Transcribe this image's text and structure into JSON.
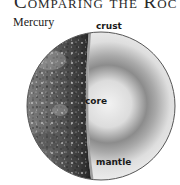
{
  "header": {
    "title": "Comparing the Roc"
  },
  "planet": {
    "name": "Mercury",
    "layers": {
      "crust": "crust",
      "core": "core",
      "mantle": "mantle"
    }
  },
  "colors": {
    "surface_dark": "#1c1c1c",
    "surface_mid": "#6e6e6e",
    "cutaway_light": "#e8e8e8",
    "mantle_shade": "#7a7a7a",
    "outline": "#555555"
  }
}
